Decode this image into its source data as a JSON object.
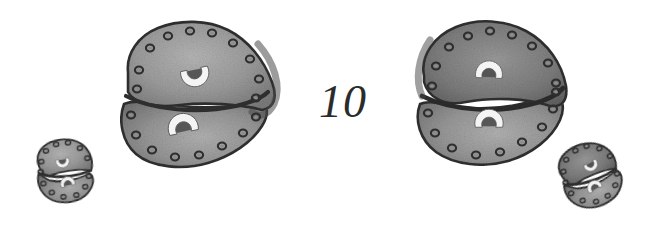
{
  "figure": {
    "number_label": "10",
    "background_color": "#ffffff",
    "ink_color": "#2b2b2b",
    "body_fill_color": "#9a9a9a",
    "body_fill_dark_color": "#6f6f6f",
    "body_fill_light_color": "#b4b4b4",
    "outline_color": "#3a3a3a",
    "mark_color": "#f2f2f2",
    "specimens": [
      {
        "name": "large-specimen-left",
        "position": "left-center",
        "size": "large",
        "lobes": 2,
        "rim_dot_count": 18,
        "mark_count": 2,
        "mark_shape": "horseshoe"
      },
      {
        "name": "large-specimen-right",
        "position": "right-center",
        "size": "large",
        "lobes": 2,
        "rim_dot_count": 18,
        "mark_count": 2,
        "mark_shape": "horseshoe"
      },
      {
        "name": "small-specimen-left",
        "position": "lower-left",
        "size": "small",
        "lobes": 2,
        "rim_dot_count": 14,
        "mark_count": 2,
        "mark_shape": "horseshoe"
      },
      {
        "name": "small-specimen-right",
        "position": "lower-right",
        "size": "small",
        "lobes": 2,
        "rim_dot_count": 14,
        "mark_count": 2,
        "mark_shape": "horseshoe"
      }
    ]
  }
}
